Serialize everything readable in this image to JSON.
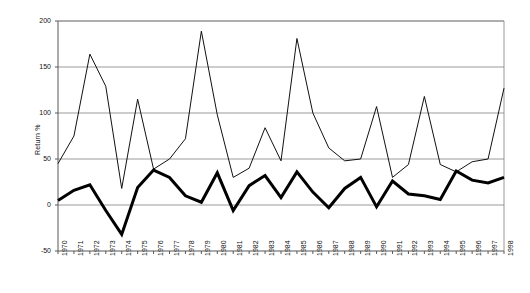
{
  "chart_data": {
    "type": "line",
    "title": "",
    "subtitle": "",
    "xlabel": "",
    "ylabel": "Return %",
    "ylim": [
      -50,
      200
    ],
    "yticks": [
      -50,
      0,
      50,
      100,
      150,
      200
    ],
    "ytick_labels": [
      "-50",
      "0",
      "50",
      "100",
      "150",
      "200"
    ],
    "grid": true,
    "grid_axis": "y",
    "legend": "none",
    "x": [
      1970,
      1971,
      1972,
      1973,
      1974,
      1975,
      1976,
      1977,
      1978,
      1979,
      1980,
      1981,
      1982,
      1983,
      1984,
      1985,
      1986,
      1987,
      1988,
      1989,
      1990,
      1991,
      1992,
      1993,
      1994,
      1995,
      1996,
      1997,
      1998
    ],
    "xtick_labels": [
      "1970",
      "1971",
      "1972",
      "1973",
      "1974",
      "1975",
      "1976",
      "1977",
      "1978",
      "1979",
      "1980",
      "1981",
      "1982",
      "1983",
      "1984",
      "1985",
      "1986",
      "1987",
      "1988",
      "1989",
      "1990",
      "1991",
      "1992",
      "1993",
      "1994",
      "1995",
      "1996",
      "1997",
      "1998"
    ],
    "series": [
      {
        "name": "thin-line-series",
        "style": "thin",
        "color": "#111111",
        "line_width": 1,
        "values": [
          45,
          75,
          164,
          129,
          18,
          115,
          39,
          50,
          72,
          189,
          98,
          30,
          40,
          84,
          48,
          181,
          100,
          62,
          48,
          50,
          107,
          30,
          44,
          118,
          44,
          36,
          47,
          50,
          127
        ]
      },
      {
        "name": "thick-line-series",
        "style": "thick",
        "color": "#000000",
        "line_width": 3,
        "values": [
          5,
          16,
          22,
          -6,
          -32,
          19,
          38,
          30,
          10,
          3,
          35,
          -6,
          21,
          32,
          8,
          36,
          14,
          -3,
          18,
          30,
          -2,
          26,
          12,
          10,
          6,
          37,
          27,
          24,
          30
        ]
      }
    ],
    "axis": {
      "plot_left": 58,
      "plot_right": 504,
      "plot_top": 21,
      "plot_bottom": 251
    },
    "colors": {
      "axis": "#595959",
      "grid": "#808080",
      "text": "#111111",
      "background": "#ffffff"
    }
  }
}
